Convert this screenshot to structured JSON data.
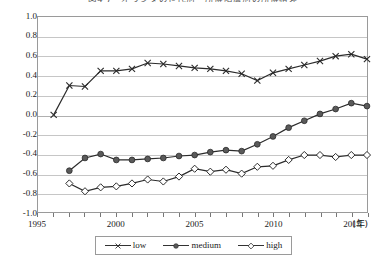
{
  "chart_data": {
    "type": "line",
    "title": "図4-7　オランダの世代別・所得階層別の所得格差",
    "xlabel": "(年)",
    "ylabel": "",
    "xlim": [
      1995,
      2016
    ],
    "ylim": [
      -1.0,
      1.0
    ],
    "yticks": [
      "1.0",
      "0.8",
      "0.6",
      "0.4",
      "0.2",
      "0.0",
      "-0.2",
      "-0.4",
      "-0.6",
      "-0.8",
      "-1.0"
    ],
    "xticks": [
      "1995",
      "2000",
      "2005",
      "2010",
      "2015"
    ],
    "grid": true,
    "legend_position": "bottom",
    "x": [
      1995,
      1996,
      1997,
      1998,
      1999,
      2000,
      2001,
      2002,
      2003,
      2004,
      2005,
      2006,
      2007,
      2008,
      2009,
      2010,
      2011,
      2012,
      2013,
      2014,
      2015,
      2016
    ],
    "series": [
      {
        "name": "low",
        "marker": "x",
        "color": "#333333",
        "values": [
          null,
          0.0,
          0.3,
          0.29,
          0.45,
          0.45,
          0.47,
          0.53,
          0.52,
          0.5,
          0.48,
          0.47,
          0.45,
          0.42,
          0.35,
          0.43,
          0.47,
          0.51,
          0.55,
          0.6,
          0.62,
          0.57
        ]
      },
      {
        "name": "medium",
        "marker": "circle",
        "color": "#555555",
        "values": [
          null,
          null,
          -0.57,
          -0.44,
          -0.4,
          -0.46,
          -0.46,
          -0.45,
          -0.44,
          -0.42,
          -0.41,
          -0.38,
          -0.36,
          -0.37,
          -0.3,
          -0.22,
          -0.13,
          -0.06,
          0.01,
          0.06,
          0.12,
          0.09
        ]
      },
      {
        "name": "high",
        "marker": "diamond",
        "color": "#ffffff",
        "values": [
          null,
          null,
          -0.7,
          -0.78,
          -0.74,
          -0.73,
          -0.7,
          -0.66,
          -0.68,
          -0.63,
          -0.55,
          -0.58,
          -0.56,
          -0.6,
          -0.53,
          -0.52,
          -0.46,
          -0.41,
          -0.41,
          -0.43,
          -0.41,
          -0.41
        ]
      }
    ]
  },
  "legend": {
    "items": [
      {
        "label": "low",
        "marker": "x"
      },
      {
        "label": "medium",
        "marker": "circle"
      },
      {
        "label": "high",
        "marker": "diamond"
      }
    ]
  }
}
